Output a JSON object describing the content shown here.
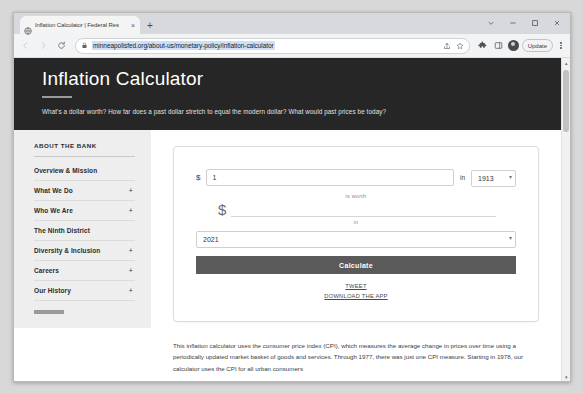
{
  "browser": {
    "tab": {
      "title": "Inflation Calculator | Federal Res",
      "favicon": "globe-icon",
      "close": "×"
    },
    "new_tab_label": "+",
    "window_controls": {
      "minimize": "minimize-icon",
      "maximize": "maximize-icon",
      "close": "close-icon",
      "chevron": "chevron-down-icon"
    },
    "toolbar": {
      "back": "back-arrow-icon",
      "forward": "forward-arrow-icon",
      "reload": "reload-icon",
      "url": "minneapolisfed.org/about-us/monetary-policy/inflation-calculator",
      "lock": "lock-icon",
      "share": "share-icon",
      "bookmark": "star-icon",
      "extensions": "extensions-puzzle-icon",
      "sidepanel": "side-panel-icon",
      "avatar": "profile-avatar",
      "update_label": "Update",
      "menu": "three-dot-menu-icon"
    }
  },
  "hero": {
    "title": "Inflation Calculator",
    "subtitle": "What's a dollar worth? How far does a past dollar stretch to equal the modern dollar? What would past prices be today?"
  },
  "sidebar": {
    "heading": "ABOUT THE BANK",
    "items": [
      {
        "label": "Overview & Mission",
        "expand": ""
      },
      {
        "label": "What We Do",
        "expand": "+"
      },
      {
        "label": "Who We Are",
        "expand": "+"
      },
      {
        "label": "The Ninth District",
        "expand": ""
      },
      {
        "label": "Diversity & Inclusion",
        "expand": "+"
      },
      {
        "label": "Careers",
        "expand": "+"
      },
      {
        "label": "Our History",
        "expand": "+"
      }
    ]
  },
  "calculator": {
    "dollar_symbol": "$",
    "amount_value": "1",
    "amount_placeholder": "",
    "in_label": "in",
    "year_from": "1913",
    "is_worth_label": "is worth",
    "result_dollar_symbol": "$",
    "result_value": "",
    "to_label": "in",
    "year_to": "2021",
    "calculate_label": "Calculate",
    "tweet_label": "TWEET",
    "download_label": "DOWNLOAD THE APP",
    "caret": "▾"
  },
  "body_copy": {
    "paragraph": "This inflation calculator uses the consumer price index (CPI), which measures the average change in prices over time using a periodically updated market basket of goods and services. Through 1977, there was just one CPI measure. Starting in 1978, our calculator uses the CPI for all urban consumers"
  },
  "scrollbar": {
    "up_arrow": "▴",
    "down_arrow": "▾"
  },
  "colors": {
    "hero_background": "#262626",
    "sidebar_background": "#eeeeee",
    "button_background": "#5a5a5a",
    "url_selection": "#cfe0f5"
  }
}
